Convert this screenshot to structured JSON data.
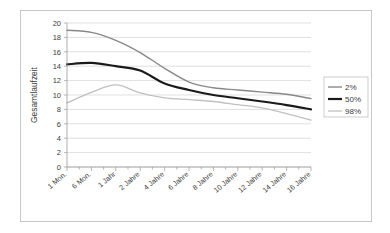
{
  "chart_data": {
    "type": "line",
    "title": "",
    "xlabel": "",
    "ylabel": "Gesamtlaufzeit",
    "ylim": [
      0,
      20
    ],
    "ytick_step": 2,
    "grid": true,
    "legend_position": "right",
    "categories": [
      "1 Mon.",
      "6 Mon.",
      "1 Jahr",
      "2 Jahre",
      "4 Jahre",
      "6 Jahre",
      "8 Jahre",
      "10 Jahre",
      "12 Jahre",
      "14 Jahre",
      "16 Jahre"
    ],
    "yticks": [
      "0",
      "2",
      "4",
      "6",
      "8",
      "10",
      "12",
      "14",
      "16",
      "18",
      "20"
    ],
    "x": [
      0,
      1,
      2,
      3,
      4,
      5,
      6,
      7,
      8,
      9,
      10
    ],
    "series": [
      {
        "name": "2%",
        "color": "#888888",
        "width": 1.4,
        "values": [
          19.0,
          18.7,
          17.6,
          15.9,
          13.7,
          11.8,
          11.0,
          10.7,
          10.4,
          10.1,
          9.5
        ]
      },
      {
        "name": "50%",
        "color": "#1a1a1a",
        "width": 2.2,
        "values": [
          14.25,
          14.45,
          14.0,
          13.4,
          11.6,
          10.7,
          10.0,
          9.55,
          9.1,
          8.6,
          8.0
        ]
      },
      {
        "name": "98%",
        "color": "#c0c0c0",
        "width": 1.3,
        "values": [
          8.9,
          10.35,
          11.4,
          10.3,
          9.6,
          9.35,
          9.1,
          8.65,
          8.2,
          7.4,
          6.5
        ]
      }
    ]
  },
  "legend": {
    "entries": [
      {
        "label": "2%"
      },
      {
        "label": "50%"
      },
      {
        "label": "98%"
      }
    ]
  },
  "axes": {
    "y_title": "Gesamtlaufzeit"
  }
}
